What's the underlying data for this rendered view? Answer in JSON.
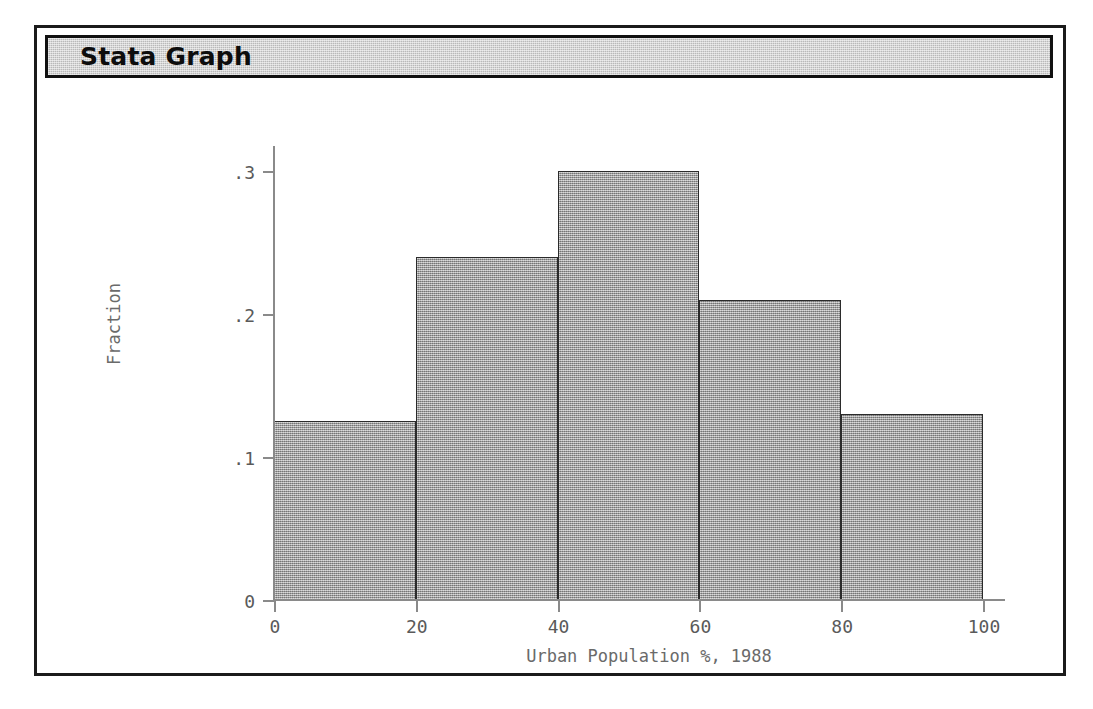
{
  "window": {
    "title": "Stata Graph"
  },
  "chart_data": {
    "type": "bar",
    "title": "",
    "subtitle": "",
    "xlabel": "Urban Population %, 1988",
    "ylabel": "Fraction",
    "categories": [
      "0-20",
      "20-40",
      "40-60",
      "60-80",
      "80-100"
    ],
    "bin_edges": [
      0,
      20,
      40,
      60,
      80,
      100
    ],
    "values": [
      0.125,
      0.24,
      0.3,
      0.21,
      0.13
    ],
    "xlim": [
      0,
      100
    ],
    "ylim": [
      0,
      0.3
    ],
    "xticks": [
      0,
      20,
      40,
      60,
      80,
      100
    ],
    "xtick_labels": [
      "0",
      "20",
      "40",
      "60",
      "80",
      "100"
    ],
    "yticks": [
      0,
      0.1,
      0.2,
      0.3
    ],
    "ytick_labels": [
      "0",
      ".1",
      ".2",
      ".3"
    ],
    "grid": false,
    "legend": false,
    "bar_fill_color": "#9e9e9e",
    "bar_border_color": "#2b2b2b",
    "axis_color": "#8a8a8a",
    "text_color": "#5a5a5a"
  }
}
